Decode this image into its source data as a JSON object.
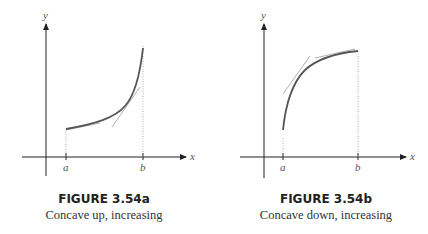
{
  "figures": [
    {
      "id": "3.54a",
      "title": "FIGURE 3.54a",
      "caption": "Concave up, increasing",
      "axis_labels": {
        "x": "x",
        "y": "y"
      },
      "tick_labels": {
        "a": "a",
        "b": "b"
      },
      "curve": "concave up, increasing from a to b",
      "tangent_lines": 2
    },
    {
      "id": "3.54b",
      "title": "FIGURE 3.54b",
      "caption": "Concave down, increasing",
      "axis_labels": {
        "x": "x",
        "y": "y"
      },
      "tick_labels": {
        "a": "a",
        "b": "b"
      },
      "curve": "concave down, increasing from a to b",
      "tangent_lines": 2
    }
  ],
  "colors": {
    "curve": "#555555",
    "tangent": "#9a9a9a",
    "axis": "#222222",
    "dotted": "#999999"
  }
}
